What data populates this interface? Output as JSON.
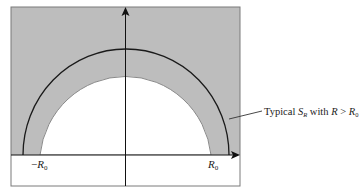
{
  "diagram": {
    "type": "contour-region",
    "colors": {
      "shaded_region": "#bdbdbd",
      "inner_region": "#ffffff",
      "path": "#1a1a1a",
      "axes": "#111111",
      "frame": "#777777"
    },
    "axis_labels": {
      "neg_r0": {
        "sign": "−",
        "main": "R",
        "sub": "0"
      },
      "pos_r0": {
        "main": "R",
        "sub": "0"
      }
    },
    "annotation": {
      "prefix": "Typical ",
      "s_main": "S",
      "s_sub": "R",
      "mid": " with ",
      "r": "R",
      "gt": " > ",
      "r0_main": "R",
      "r0_sub": "0"
    }
  }
}
